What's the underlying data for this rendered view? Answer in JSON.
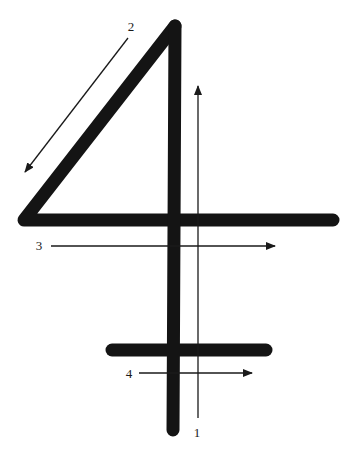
{
  "diagram": {
    "ink_color": "#141414",
    "arrow_color": "#1a1a1a",
    "strokes": [
      {
        "name": "diagonal-and-crossbar",
        "points": [
          [
            175,
            26
          ],
          [
            24,
            220
          ],
          [
            333,
            220
          ]
        ]
      },
      {
        "name": "main-vertical",
        "points": [
          [
            175,
            26
          ],
          [
            173,
            430
          ]
        ]
      },
      {
        "name": "lower-crossbar",
        "points": [
          [
            112,
            350
          ],
          [
            266,
            350
          ]
        ]
      }
    ],
    "arrows": [
      {
        "order": "1",
        "from": [
          198,
          418
        ],
        "to": [
          198,
          86
        ],
        "label_pos": [
          197,
          437
        ]
      },
      {
        "order": "2",
        "from": [
          128,
          38
        ],
        "to": [
          25,
          172
        ],
        "label_pos": [
          131,
          31
        ]
      },
      {
        "order": "3",
        "from": [
          51,
          246
        ],
        "to": [
          275,
          246
        ],
        "label_pos": [
          39,
          250
        ]
      },
      {
        "order": "4",
        "from": [
          139,
          373
        ],
        "to": [
          252,
          373
        ],
        "label_pos": [
          129,
          378
        ]
      }
    ]
  }
}
